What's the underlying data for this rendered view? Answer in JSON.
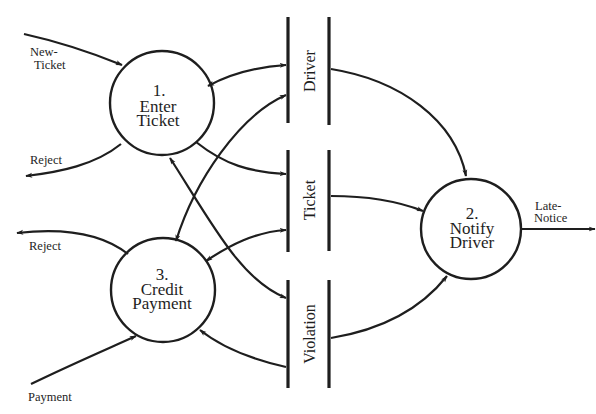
{
  "diagram": {
    "type": "data-flow-diagram",
    "colors": {
      "ink": "#1e1e1e",
      "background": "#ffffff"
    },
    "processes": [
      {
        "id": "p1",
        "number": "1.",
        "line1": "Enter",
        "line2": "Ticket"
      },
      {
        "id": "p2",
        "number": "2.",
        "line1": "Notify",
        "line2": "Driver"
      },
      {
        "id": "p3",
        "number": "3.",
        "line1": "Credit",
        "line2": "Payment"
      }
    ],
    "data_stores": [
      {
        "id": "s1",
        "label": "Driver"
      },
      {
        "id": "s2",
        "label": "Ticket"
      },
      {
        "id": "s3",
        "label": "Violation"
      }
    ],
    "flows": [
      {
        "id": "f1",
        "label_line1": "New-",
        "label_line2": "Ticket",
        "from": "external",
        "to": "1. Enter Ticket"
      },
      {
        "id": "f2",
        "label": "Reject",
        "from": "1. Enter Ticket",
        "to": "external"
      },
      {
        "id": "f3",
        "label": "Reject",
        "from": "3. Credit Payment",
        "to": "external"
      },
      {
        "id": "f4",
        "label": "Payment",
        "from": "external",
        "to": "3. Credit Payment"
      },
      {
        "id": "f5",
        "label_line1": "Late-",
        "label_line2": "Notice",
        "from": "2. Notify Driver",
        "to": "external"
      },
      {
        "id": "f6",
        "label": "",
        "from": "1. Enter Ticket",
        "to": "Driver",
        "bidirectional": true
      },
      {
        "id": "f7",
        "label": "",
        "from": "1. Enter Ticket",
        "to": "Ticket"
      },
      {
        "id": "f8",
        "label": "",
        "from": "1. Enter Ticket",
        "to": "Violation",
        "bidirectional": true
      },
      {
        "id": "f9",
        "label": "",
        "from": "3. Credit Payment",
        "to": "Driver",
        "bidirectional": true
      },
      {
        "id": "f10",
        "label": "",
        "from": "3. Credit Payment",
        "to": "Ticket",
        "bidirectional": true
      },
      {
        "id": "f11",
        "label": "",
        "from": "Violation",
        "to": "3. Credit Payment"
      },
      {
        "id": "f12",
        "label": "",
        "from": "Driver",
        "to": "2. Notify Driver"
      },
      {
        "id": "f13",
        "label": "",
        "from": "Ticket",
        "to": "2. Notify Driver"
      },
      {
        "id": "f14",
        "label": "",
        "from": "Violation",
        "to": "2. Notify Driver"
      }
    ]
  }
}
